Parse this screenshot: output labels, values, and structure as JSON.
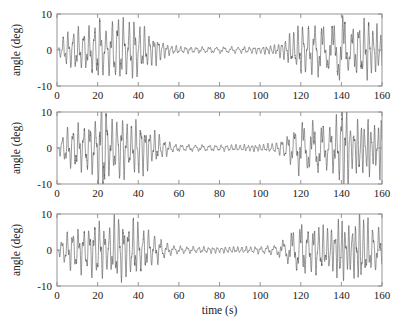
{
  "figure": {
    "background": "#ffffff",
    "line_color": "#5a5a5a",
    "axis_color": "#8a8a8a",
    "xlabel": "time (s)",
    "ylabel_panel_1": "angle (deg)",
    "ylabel_panel_2": "angle (deg)",
    "ylabel_panel_3": "angle (deg)"
  },
  "chart_data": {
    "type": "line",
    "title": "",
    "xlabel": "time (s)",
    "ylabel": "angle (deg)",
    "xlim": [
      0,
      160
    ],
    "ylim": [
      -10,
      10
    ],
    "xticks": [
      0,
      20,
      40,
      60,
      80,
      100,
      120,
      140,
      160
    ],
    "xticklabels": [
      "0",
      "20",
      "40",
      "60",
      "80",
      "100",
      "120",
      "140",
      "160"
    ],
    "yticks": [
      -10,
      0,
      10
    ],
    "yticklabels": [
      "-10",
      "0",
      "10"
    ],
    "grid": false,
    "legend": null,
    "n_panels": 3,
    "shared_x_axis": true,
    "x_tick_labels_on_all_panels": true,
    "panels": [
      {
        "index": 1,
        "ylabel": "angle (deg)",
        "xlabel": "",
        "xticklabels_visible": true,
        "description": "Beating oscillation: large amplitude at both ends, low-amplitude high-frequency ripple in the middle (about t=55 to t=110).",
        "carrier_period_s": 2.6,
        "ripple_period_s": 1.05,
        "envelope_x": [
          0,
          3,
          6,
          10,
          14,
          18,
          20,
          24,
          28,
          30,
          34,
          38,
          42,
          46,
          50,
          55,
          60,
          70,
          80,
          90,
          100,
          108,
          112,
          116,
          120,
          124,
          128,
          132,
          136,
          140,
          144,
          148,
          152,
          156,
          160
        ],
        "envelope_y": [
          0.6,
          3.2,
          4.6,
          5.2,
          5.0,
          6.0,
          8.2,
          5.4,
          7.0,
          9.2,
          6.3,
          7.6,
          5.5,
          4.2,
          3.0,
          1.4,
          0.9,
          0.8,
          0.8,
          0.8,
          0.9,
          1.3,
          2.6,
          4.4,
          6.6,
          5.4,
          6.8,
          5.3,
          5.8,
          9.0,
          5.0,
          6.4,
          8.0,
          6.0,
          5.0
        ],
        "clipped": false,
        "ymax_observed": 9.3,
        "ymin_observed": -9.4
      },
      {
        "index": 2,
        "ylabel": "angle (deg)",
        "xlabel": "",
        "xticklabels_visible": true,
        "description": "Same beating structure but with transient bursts exceeding the +/-10 deg axis limits near t=21-24 and t=140-143.",
        "carrier_period_s": 2.6,
        "ripple_period_s": 1.05,
        "envelope_x": [
          0,
          3,
          6,
          10,
          14,
          18,
          20,
          21,
          22,
          23,
          24,
          26,
          28,
          32,
          36,
          40,
          44,
          48,
          52,
          56,
          60,
          70,
          80,
          90,
          100,
          108,
          112,
          116,
          120,
          124,
          128,
          132,
          136,
          139,
          140,
          141,
          142,
          143,
          145,
          148,
          152,
          156,
          160
        ],
        "envelope_y": [
          0.6,
          3.4,
          5.0,
          5.6,
          5.5,
          6.4,
          8.4,
          12.0,
          12.5,
          12.0,
          11.5,
          6.2,
          6.8,
          8.4,
          5.2,
          7.5,
          5.4,
          4.0,
          2.6,
          1.3,
          0.9,
          0.8,
          0.8,
          0.8,
          0.9,
          1.3,
          2.6,
          4.4,
          6.6,
          5.6,
          6.6,
          5.2,
          6.0,
          8.6,
          11.8,
          12.4,
          12.0,
          11.0,
          5.2,
          6.6,
          7.4,
          5.6,
          7.8
        ],
        "clipped": true,
        "clip_events": [
          {
            "t_start": 20.8,
            "t_end": 24.2,
            "exceeds": "+/-10 deg"
          },
          {
            "t_start": 139.0,
            "t_end": 143.2,
            "exceeds": "+/-10 deg"
          }
        ],
        "ymax_observed": 12.5,
        "ymin_observed": -12.5
      },
      {
        "index": 3,
        "ylabel": "angle (deg)",
        "xlabel": "time (s)",
        "xticklabels_visible": true,
        "description": "Beating oscillation very similar to panel 1; large amplitude at both ends with quiet high-frequency middle section.",
        "carrier_period_s": 2.6,
        "ripple_period_s": 1.05,
        "envelope_x": [
          0,
          3,
          6,
          10,
          14,
          18,
          20,
          24,
          28,
          30,
          34,
          38,
          42,
          46,
          50,
          55,
          60,
          70,
          80,
          90,
          100,
          108,
          112,
          116,
          120,
          124,
          128,
          132,
          136,
          140,
          144,
          148,
          150,
          154,
          158,
          160
        ],
        "envelope_y": [
          0.6,
          3.3,
          4.8,
          5.4,
          5.2,
          6.1,
          7.9,
          5.2,
          7.2,
          9.0,
          6.1,
          7.4,
          5.2,
          4.4,
          3.1,
          1.4,
          0.9,
          0.8,
          0.8,
          0.8,
          0.9,
          1.3,
          2.7,
          4.5,
          6.8,
          5.2,
          6.6,
          5.0,
          5.6,
          8.4,
          5.2,
          8.6,
          8.8,
          6.2,
          5.4,
          3.6
        ],
        "clipped": false,
        "ymax_observed": 9.0,
        "ymin_observed": -9.4
      }
    ]
  }
}
